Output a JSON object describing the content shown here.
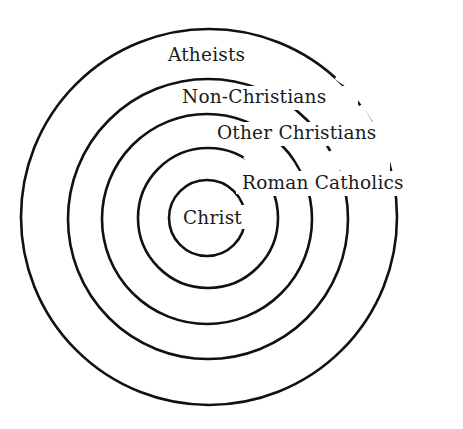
{
  "diagram": {
    "type": "concentric-circles",
    "stroke_color": "#111111",
    "background_color": "#ffffff",
    "rings": [
      {
        "id": "atheists",
        "label": "Atheists",
        "cx": 209,
        "cy": 217,
        "r": 188
      },
      {
        "id": "non-christians",
        "label": "Non-Christians",
        "cx": 208,
        "cy": 219,
        "r": 140
      },
      {
        "id": "other-christians",
        "label": "Other Christians",
        "cx": 207,
        "cy": 219,
        "r": 105
      },
      {
        "id": "roman-catholics",
        "label": "Roman Catholics",
        "cx": 208,
        "cy": 218,
        "r": 70
      },
      {
        "id": "christ",
        "label": "Christ",
        "cx": 207,
        "cy": 218,
        "r": 38
      }
    ],
    "labels": {
      "atheists": "Atheists",
      "non_christians": "Non-Christians",
      "other_christians": "Other Christians",
      "roman_catholics": "Roman Catholics",
      "christ": "Christ"
    }
  }
}
